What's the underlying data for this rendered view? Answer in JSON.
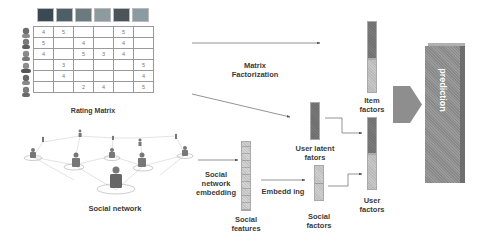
{
  "rating_matrix": {
    "label": "Rating Matrix",
    "item_icons": [
      "item-1",
      "item-2",
      "item-3",
      "item-4",
      "item-5",
      "item-6"
    ],
    "item_colors": [
      "#3b4a52",
      "#4d5f66",
      "#6a7a7e",
      "#8d9aa0",
      "#4a5459",
      "#8a9ba3"
    ],
    "user_icons": [
      "user-1",
      "user-2",
      "user-3",
      "user-4",
      "user-5",
      "user-6"
    ],
    "rows": [
      [
        "4",
        "5",
        "",
        "",
        "5",
        ""
      ],
      [
        "5",
        "",
        "4",
        "",
        "4",
        ""
      ],
      [
        "4",
        "",
        "5",
        "3",
        "4",
        ""
      ],
      [
        "",
        "3",
        "",
        "",
        "",
        "5"
      ],
      [
        "",
        "4",
        "",
        "",
        "",
        "4"
      ],
      [
        "",
        "",
        "2",
        "4",
        "",
        "5"
      ]
    ]
  },
  "social_network": {
    "label": "Social network"
  },
  "labels": {
    "matrix_factorization": [
      "Matrix",
      "Factorization"
    ],
    "item_factors": [
      "Item",
      "factors"
    ],
    "user_latent_factors": [
      "User latent",
      "fators"
    ],
    "user_factors": [
      "User",
      "factors"
    ],
    "social_network_embedding": [
      "Social",
      "network",
      "embedding"
    ],
    "embedding": "Embedd ing",
    "social_features": [
      "Social",
      "features"
    ],
    "social_factors": [
      "Social",
      "factors"
    ],
    "prediction": "prediction"
  },
  "colors": {
    "bar_dark": "#7a7a7a",
    "bar_light": "#c8c8c8",
    "prediction_face": "#9b9b9b",
    "prediction_side": "#6e6e6e",
    "arrow_shape": "#8e8e8e"
  }
}
